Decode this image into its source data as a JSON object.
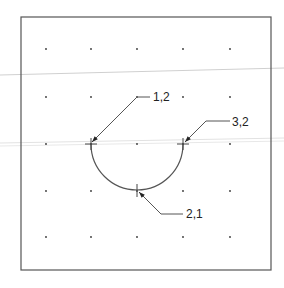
{
  "figure": {
    "frame": {
      "x": 21,
      "y": 17,
      "width": 250,
      "height": 253
    },
    "grid": {
      "cols_x": [
        46,
        91,
        137,
        183,
        230
      ],
      "rows_y": [
        49,
        97,
        144,
        191,
        237
      ]
    },
    "arc": {
      "start": [
        91,
        144
      ],
      "mid": [
        137,
        190
      ],
      "end": [
        183,
        144
      ],
      "type": "semicircle"
    },
    "callouts": [
      {
        "label": "1,2",
        "text_pos": [
          153,
          101
        ],
        "path": [
          [
            150,
            97
          ],
          [
            137,
            97
          ],
          [
            92,
            142
          ]
        ]
      },
      {
        "label": "3,2",
        "text_pos": [
          232,
          126
        ],
        "path": [
          [
            230,
            121
          ],
          [
            206,
            121
          ],
          [
            185,
            142
          ]
        ]
      },
      {
        "label": "2,1",
        "text_pos": [
          186,
          218
        ],
        "path": [
          [
            183,
            214
          ],
          [
            161,
            214
          ],
          [
            139,
            192
          ]
        ]
      }
    ],
    "colors": {
      "line": "#555555",
      "dot": "#333333",
      "scan_line": "#d8d8d8"
    }
  }
}
